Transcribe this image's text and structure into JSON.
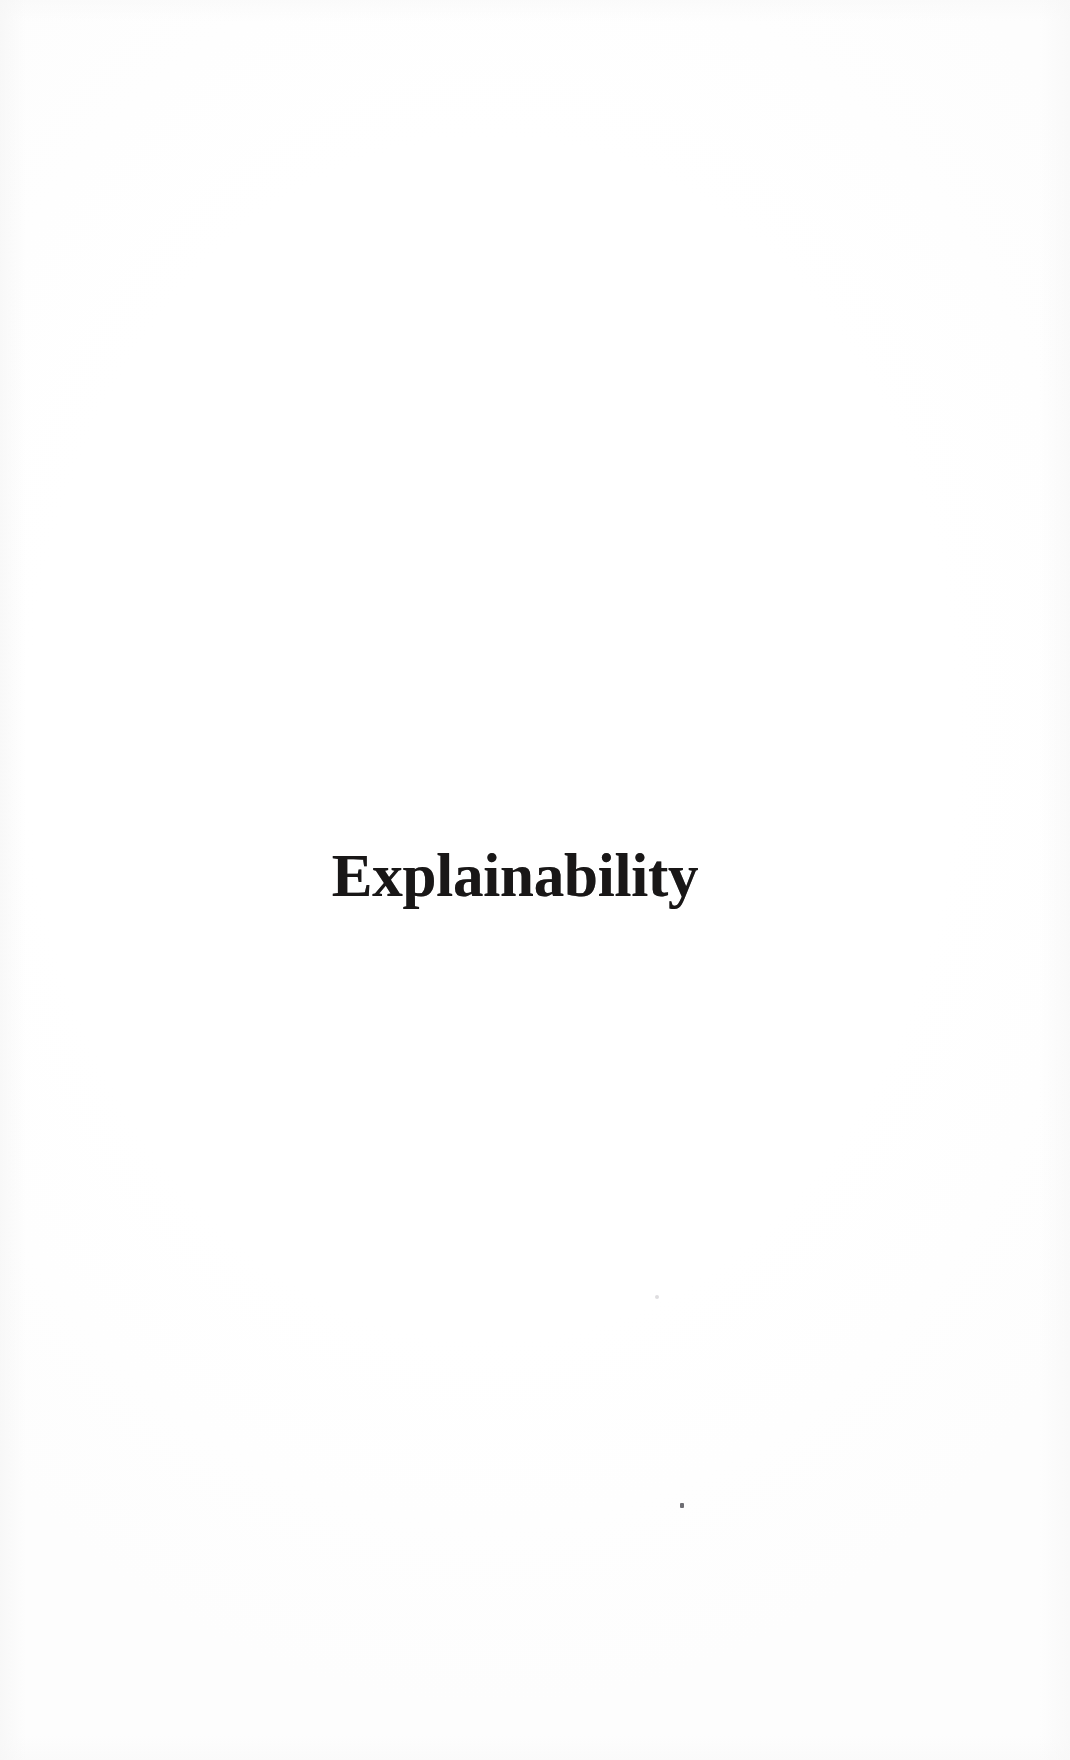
{
  "document": {
    "page_type": "part-divider",
    "page_title": "Explainability",
    "background_color": "#ffffff",
    "ink_color": "#191717"
  },
  "part_divider": {
    "title": "Explainability"
  },
  "artifacts": {
    "specks": [
      {
        "name": "scan-speck-faint",
        "color": "#a8a6ac"
      },
      {
        "name": "scan-speck-dark",
        "color": "#4a4850"
      }
    ]
  }
}
